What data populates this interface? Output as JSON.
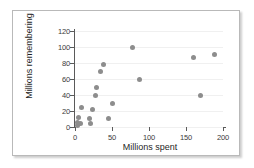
{
  "chart_data": {
    "type": "scatter",
    "title": "",
    "xlabel": "Millions spent",
    "ylabel": "Millions remembering",
    "xlim": [
      0,
      200
    ],
    "ylim": [
      0,
      120
    ],
    "xticks": [
      0,
      50,
      100,
      150,
      200
    ],
    "yticks": [
      0,
      20,
      40,
      60,
      80,
      100,
      120
    ],
    "grid": "horizontal",
    "legend": "none",
    "marker_color": "#8d8d8d",
    "axis_color": "#5a5a5a",
    "points": [
      {
        "x": 3,
        "y": 2
      },
      {
        "x": 4,
        "y": 6
      },
      {
        "x": 5,
        "y": 12
      },
      {
        "x": 8,
        "y": 5
      },
      {
        "x": 9,
        "y": 24
      },
      {
        "x": 19,
        "y": 11
      },
      {
        "x": 21,
        "y": 5
      },
      {
        "x": 24,
        "y": 22
      },
      {
        "x": 28,
        "y": 39
      },
      {
        "x": 29,
        "y": 50
      },
      {
        "x": 34,
        "y": 70
      },
      {
        "x": 39,
        "y": 78
      },
      {
        "x": 45,
        "y": 11
      },
      {
        "x": 51,
        "y": 30
      },
      {
        "x": 78,
        "y": 99
      },
      {
        "x": 87,
        "y": 60
      },
      {
        "x": 160,
        "y": 87
      },
      {
        "x": 170,
        "y": 39
      },
      {
        "x": 188,
        "y": 91
      }
    ]
  }
}
